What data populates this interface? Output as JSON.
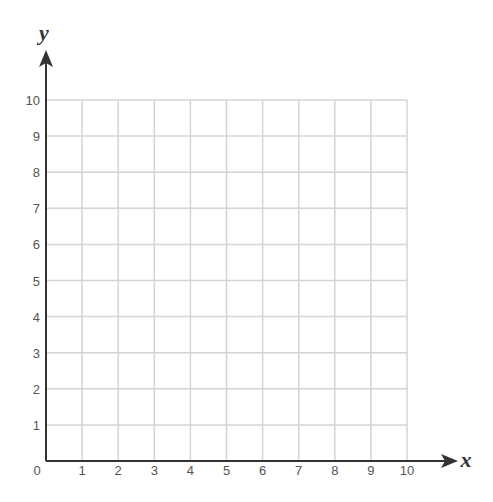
{
  "chart_data": {
    "type": "scatter",
    "title": "",
    "xlabel": "x",
    "ylabel": "y",
    "xlim": [
      0,
      10
    ],
    "ylim": [
      0,
      10
    ],
    "x_ticks": [
      "0",
      "1",
      "2",
      "3",
      "4",
      "5",
      "6",
      "7",
      "8",
      "9",
      "10"
    ],
    "y_ticks": [
      "1",
      "2",
      "3",
      "4",
      "5",
      "6",
      "7",
      "8",
      "9",
      "10"
    ],
    "grid": true,
    "series": []
  },
  "colors": {
    "grid": "#d4d4d4",
    "axis": "#333333",
    "text": "#555555"
  }
}
